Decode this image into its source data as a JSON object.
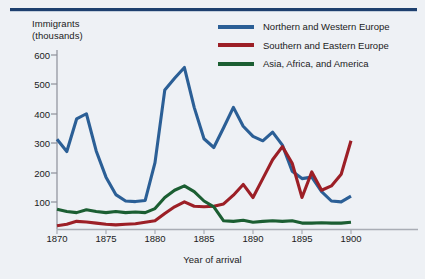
{
  "figure": {
    "ylabel_line1": "Immigrants",
    "ylabel_line2": "(thousands)",
    "ylabel": "Immigrants\n(thousands)",
    "xlabel": "Year of arrival"
  },
  "legend": {
    "position": "top-right",
    "items": [
      {
        "label": "Northern and Western Europe",
        "color": "#2b5f96",
        "icon": "line-swatch-icon"
      },
      {
        "label": "Southern and Eastern Europe",
        "color": "#9c1f26",
        "icon": "line-swatch-icon"
      },
      {
        "label": "Asia, Africa, and America",
        "color": "#1b5e32",
        "icon": "line-swatch-icon"
      }
    ]
  },
  "axes": {
    "y_ticks": [
      "600",
      "500",
      "400",
      "300",
      "200",
      "100"
    ],
    "x_ticks": [
      "1870",
      "1875",
      "1880",
      "1885",
      "1890",
      "1895",
      "1900"
    ]
  },
  "colors": {
    "background": "#eef1f5",
    "rule": "#1d3f6e",
    "axis": "#8d9099",
    "text": "#1b1b1b",
    "northern_western_europe": "#2b5f96",
    "southern_eastern_europe": "#9c1f26",
    "asia_africa_america": "#1b5e32"
  },
  "chart_data": {
    "type": "line",
    "title": "",
    "subtitle": "",
    "xlabel": "Year of arrival",
    "ylabel": "Immigrants (thousands)",
    "xlim": [
      1870,
      1900
    ],
    "ylim": [
      0,
      620
    ],
    "grid": false,
    "legend_position": "top-right",
    "x_tick_labels": [
      "1870",
      "1875",
      "1880",
      "1885",
      "1890",
      "1895",
      "1900"
    ],
    "y_tick_labels": [
      "100",
      "200",
      "300",
      "400",
      "500",
      "600"
    ],
    "x": [
      1870,
      1871,
      1872,
      1873,
      1874,
      1875,
      1876,
      1877,
      1878,
      1879,
      1880,
      1881,
      1882,
      1883,
      1884,
      1885,
      1886,
      1887,
      1888,
      1889,
      1890,
      1891,
      1892,
      1893,
      1894,
      1895,
      1896,
      1897,
      1898,
      1899,
      1900
    ],
    "series": [
      {
        "name": "Northern and Western Europe",
        "color": "#2b5f96",
        "values": [
          310,
          268,
          380,
          398,
          270,
          180,
          120,
          98,
          96,
          100,
          230,
          480,
          520,
          557,
          420,
          312,
          282,
          350,
          420,
          355,
          320,
          305,
          335,
          290,
          200,
          175,
          180,
          130,
          98,
          95,
          115
        ]
      },
      {
        "name": "Southern and Eastern Europe",
        "color": "#9c1f26",
        "values": [
          13,
          18,
          28,
          26,
          22,
          18,
          16,
          18,
          20,
          25,
          30,
          55,
          78,
          95,
          80,
          78,
          80,
          88,
          118,
          155,
          110,
          175,
          240,
          285,
          228,
          110,
          198,
          135,
          150,
          190,
          305
        ]
      },
      {
        "name": "Asia, Africa, and America",
        "color": "#1b5e32",
        "values": [
          70,
          62,
          58,
          68,
          62,
          58,
          62,
          58,
          60,
          58,
          72,
          110,
          135,
          150,
          130,
          98,
          78,
          30,
          28,
          32,
          25,
          28,
          30,
          28,
          30,
          22,
          22,
          23,
          22,
          22,
          25
        ]
      }
    ]
  }
}
